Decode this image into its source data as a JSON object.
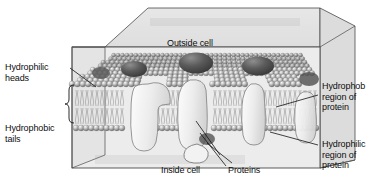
{
  "figure": {
    "type": "biology-diagram"
  },
  "labels": {
    "hydrophilic_heads": "Hydrophilic\nheads",
    "hydrophilic_heads_line1": "Hydrophilic",
    "hydrophilic_heads_line2": "heads",
    "hydrophobic_tails_line1": "Hydrophobic",
    "hydrophobic_tails_line2": "tails",
    "hydrophob_region_line1": "Hydrophob",
    "hydrophob_region_line2": "region of",
    "hydrophob_region_line3": "protein",
    "hydrophilic_region_line1": "Hydrophilic",
    "hydrophilic_region_line2": "region of",
    "hydrophilic_region_line3": "protein",
    "outside_cell": "Outside cell",
    "inside_cell": "Inside cell",
    "proteins": "Proteins"
  },
  "colors": {
    "background": "#ffffff",
    "box_fill": "#e9e9e9",
    "box_top_fill": "#e3e3e3",
    "box_side_fill": "#dcdcdc",
    "box_stroke": "#4a4a4a",
    "head_light": "#f0f0f0",
    "head_mid": "#a8a8a8",
    "head_dark": "#6e6e6e",
    "tail_stroke": "#8a8a8a",
    "protein_fill": "#ededed",
    "protein_stroke": "#7a7a7a",
    "dome_dark": "#4e4e4e",
    "dome_mid": "#6b6b6b",
    "text": "#0d0d0d",
    "leader_line": "#1a1a1a"
  },
  "structures": {
    "membrane": "phospholipid bilayer",
    "upper_leaflet": "hydrophilic phosphate heads, outer surface",
    "lower_leaflet": "hydrophilic phosphate heads, inner surface",
    "core": "hydrophobic fatty acid tails",
    "transmembrane_proteins": 4,
    "surface_domes": 3
  }
}
